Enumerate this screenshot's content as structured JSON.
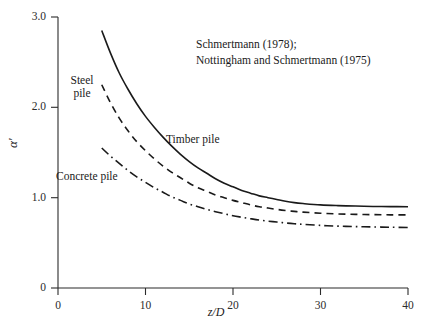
{
  "chart_data": {
    "type": "line",
    "title": "",
    "xlabel": "z/D",
    "ylabel": "α'",
    "xlim": [
      0,
      40
    ],
    "ylim": [
      0,
      3.0
    ],
    "xticks": [
      "0",
      "10",
      "20",
      "30",
      "40"
    ],
    "xtick_values": [
      0,
      10,
      20,
      30,
      40
    ],
    "yticks": [
      "0",
      "1.0",
      "2.0",
      "3.0"
    ],
    "ytick_values": [
      0,
      1.0,
      2.0,
      3.0
    ],
    "grid": false,
    "legend_position": "inline-annotations",
    "annotations": [
      "Schmertmann (1978);",
      "Nottingham and Schmertmann (1975)"
    ],
    "series": [
      {
        "name": "Timber pile",
        "style": "solid",
        "color": "#1a1a1a",
        "x": [
          5,
          6,
          7,
          8,
          9,
          10,
          11,
          12,
          13,
          14,
          15,
          16,
          17,
          18,
          19,
          20,
          21,
          22,
          23,
          24,
          25,
          26,
          27,
          28,
          30,
          32,
          34,
          36,
          38,
          40
        ],
        "values": [
          2.85,
          2.6,
          2.38,
          2.2,
          2.04,
          1.9,
          1.78,
          1.67,
          1.57,
          1.48,
          1.4,
          1.33,
          1.27,
          1.21,
          1.16,
          1.12,
          1.08,
          1.05,
          1.02,
          1.0,
          0.98,
          0.96,
          0.945,
          0.935,
          0.92,
          0.912,
          0.907,
          0.903,
          0.901,
          0.9
        ]
      },
      {
        "name": "Steel pile",
        "style": "dashed",
        "color": "#1a1a1a",
        "x": [
          5,
          6,
          7,
          8,
          9,
          10,
          11,
          12,
          13,
          14,
          15,
          16,
          17,
          18,
          19,
          20,
          21,
          22,
          23,
          24,
          25,
          26,
          27,
          28,
          30,
          32,
          34,
          36,
          38,
          40
        ],
        "values": [
          2.25,
          2.05,
          1.88,
          1.74,
          1.62,
          1.52,
          1.43,
          1.35,
          1.28,
          1.22,
          1.16,
          1.11,
          1.07,
          1.03,
          1.0,
          0.97,
          0.945,
          0.92,
          0.9,
          0.885,
          0.87,
          0.858,
          0.848,
          0.84,
          0.828,
          0.82,
          0.815,
          0.812,
          0.81,
          0.81
        ]
      },
      {
        "name": "Concrete pile",
        "style": "dash-dot",
        "color": "#1a1a1a",
        "x": [
          5,
          6,
          7,
          8,
          9,
          10,
          11,
          12,
          13,
          14,
          15,
          16,
          17,
          18,
          19,
          20,
          21,
          22,
          23,
          24,
          25,
          26,
          27,
          28,
          30,
          32,
          34,
          36,
          38,
          40
        ],
        "values": [
          1.55,
          1.46,
          1.38,
          1.3,
          1.23,
          1.17,
          1.11,
          1.06,
          1.01,
          0.97,
          0.93,
          0.9,
          0.87,
          0.845,
          0.822,
          0.8,
          0.783,
          0.767,
          0.752,
          0.74,
          0.73,
          0.72,
          0.712,
          0.705,
          0.693,
          0.685,
          0.68,
          0.676,
          0.673,
          0.67
        ]
      }
    ]
  },
  "labels": {
    "steel": "Steel\npile",
    "timber": "Timber pile",
    "concrete": "Concrete pile"
  },
  "annotation_line1": "Schmertmann (1978);",
  "annotation_line2": "Nottingham and Schmertmann (1975)",
  "axis": {
    "x_title": "z/D",
    "y_title": "α'"
  }
}
